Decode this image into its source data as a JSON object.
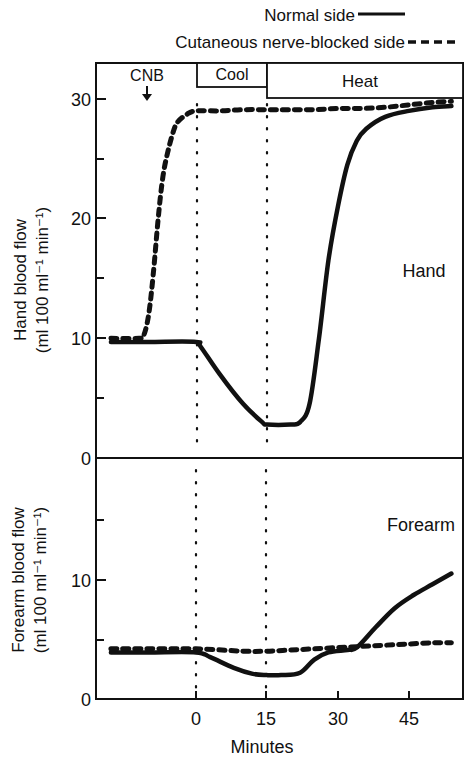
{
  "legend": {
    "normal_label": "Normal side",
    "blocked_label": "Cutaneous nerve-blocked side"
  },
  "phases": {
    "cnb_label": "CNB",
    "cool_label": "Cool",
    "heat_label": "Heat"
  },
  "x_axis": {
    "label": "Minutes",
    "ticks": [
      "0",
      "15",
      "30",
      "45"
    ]
  },
  "hand_panel": {
    "panel_label": "Hand",
    "ylabel_line1": "Hand blood flow",
    "ylabel_line2": "(ml 100 ml⁻¹ min⁻¹)",
    "ticks": [
      "0",
      "10",
      "20",
      "30"
    ]
  },
  "forearm_panel": {
    "panel_label": "Forearm",
    "ylabel_line1": "Forearm blood flow",
    "ylabel_line2": "(ml 100 ml⁻¹ min⁻¹)",
    "ticks": [
      "0",
      "10"
    ]
  },
  "chart_data": [
    {
      "type": "line",
      "title": "Hand",
      "xlabel": "Minutes",
      "ylabel": "Hand blood flow (ml 100 ml-1 min-1)",
      "xlim": [
        -21,
        56
      ],
      "ylim": [
        0,
        31
      ],
      "x_ticks": [
        0,
        15,
        30,
        45
      ],
      "y_ticks": [
        0,
        10,
        20,
        30
      ],
      "minor_y_ticks": [
        5,
        15,
        25
      ],
      "grid": false,
      "legend_position": "top-right",
      "annotations": [
        {
          "text": "CNB",
          "x": -12,
          "type": "arrow-down"
        },
        {
          "text": "Cool",
          "x_range": [
            0,
            15
          ]
        },
        {
          "text": "Heat",
          "x_range": [
            15,
            56
          ]
        },
        {
          "type": "vline-dotted",
          "x": 0
        },
        {
          "type": "vline-dotted",
          "x": 15
        }
      ],
      "series": [
        {
          "name": "Normal side",
          "style": "solid",
          "x": [
            -18,
            -10,
            0,
            1,
            5,
            10,
            14,
            15,
            20,
            22,
            24,
            26,
            28,
            30,
            32,
            34,
            36,
            40,
            45,
            50,
            54
          ],
          "y": [
            9.7,
            9.7,
            9.7,
            9.3,
            7.0,
            4.5,
            3.0,
            2.8,
            2.8,
            3.0,
            4.5,
            10.0,
            16.5,
            21.0,
            24.5,
            26.5,
            27.5,
            28.5,
            29.0,
            29.3,
            29.4
          ]
        },
        {
          "name": "Cutaneous nerve-blocked side",
          "style": "dashed",
          "x": [
            -18,
            -12,
            -11,
            -10,
            -9,
            -8,
            -7,
            -6,
            -5,
            -4,
            -2,
            0,
            5,
            10,
            15,
            20,
            25,
            30,
            35,
            40,
            45,
            50,
            54
          ],
          "y": [
            10.0,
            10.0,
            10.3,
            12.0,
            15.5,
            20.0,
            23.5,
            25.5,
            27.0,
            28.0,
            28.7,
            29.0,
            29.0,
            29.1,
            29.1,
            29.1,
            29.1,
            29.2,
            29.2,
            29.3,
            29.5,
            29.7,
            29.8
          ]
        }
      ]
    },
    {
      "type": "line",
      "title": "Forearm",
      "xlabel": "Minutes",
      "ylabel": "Forearm blood flow (ml 100 ml-1 min-1)",
      "xlim": [
        -21,
        56
      ],
      "ylim": [
        0,
        20
      ],
      "x_ticks": [
        0,
        15,
        30,
        45
      ],
      "y_ticks": [
        0,
        10
      ],
      "minor_y_ticks": [
        5,
        15
      ],
      "grid": false,
      "annotations": [
        {
          "type": "vline-dotted",
          "x": 0
        },
        {
          "type": "vline-dotted",
          "x": 15
        }
      ],
      "series": [
        {
          "name": "Normal side",
          "style": "solid",
          "x": [
            -18,
            -10,
            0,
            3,
            8,
            12,
            15,
            18,
            22,
            25,
            28,
            32,
            34,
            38,
            42,
            46,
            50,
            54
          ],
          "y": [
            3.9,
            3.9,
            3.9,
            3.5,
            2.6,
            2.1,
            2.0,
            2.0,
            2.2,
            3.3,
            3.9,
            4.1,
            4.3,
            6.0,
            7.6,
            8.7,
            9.6,
            10.5
          ]
        },
        {
          "name": "Cutaneous nerve-blocked side",
          "style": "dashed",
          "x": [
            -18,
            -10,
            0,
            10,
            15,
            20,
            25,
            30,
            35,
            40,
            45,
            50,
            54
          ],
          "y": [
            4.2,
            4.2,
            4.2,
            4.0,
            4.0,
            4.1,
            4.2,
            4.3,
            4.4,
            4.5,
            4.6,
            4.7,
            4.7
          ]
        }
      ]
    }
  ]
}
